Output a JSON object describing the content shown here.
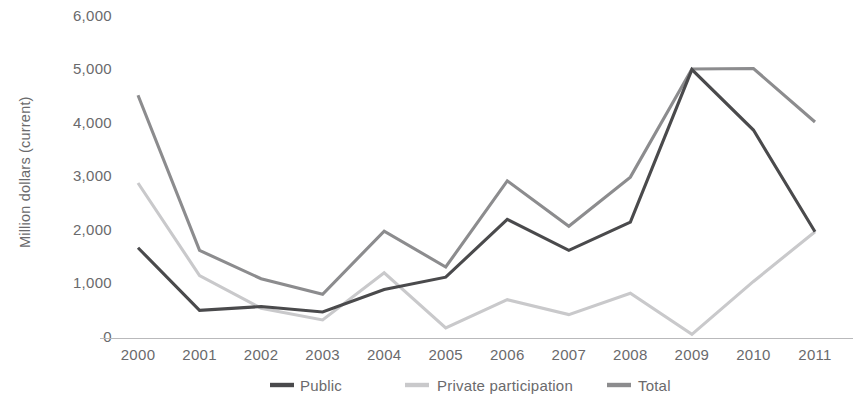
{
  "chart_data": {
    "type": "line",
    "title": "",
    "subtitle": "",
    "xlabel": "",
    "ylabel": "Million dollars (current)",
    "categories": [
      "2000",
      "2001",
      "2002",
      "2003",
      "2004",
      "2005",
      "2006",
      "2007",
      "2008",
      "2009",
      "2010",
      "2011"
    ],
    "x": [
      2000,
      2001,
      2002,
      2003,
      2004,
      2005,
      2006,
      2007,
      2008,
      2009,
      2010,
      2011
    ],
    "ylim": [
      0,
      6000
    ],
    "yticks": [
      0,
      1000,
      2000,
      3000,
      4000,
      5000,
      6000
    ],
    "ytick_labels": [
      "0",
      "1,000",
      "2,000",
      "3,000",
      "4,000",
      "5,000",
      "6,000"
    ],
    "grid": false,
    "legend_position": "bottom",
    "series": [
      {
        "name": "Public",
        "color": "#4a4a4c",
        "values": [
          1650,
          480,
          550,
          450,
          870,
          1100,
          2180,
          1600,
          2130,
          4980,
          3850,
          1950
        ]
      },
      {
        "name": "Private participation",
        "color": "#c9c9cb",
        "values": [
          2860,
          1130,
          520,
          300,
          1180,
          150,
          680,
          400,
          800,
          30,
          1020,
          1950
        ]
      },
      {
        "name": "Total",
        "color": "#8c8c8e",
        "values": [
          4500,
          1600,
          1070,
          780,
          1960,
          1290,
          2900,
          2050,
          2970,
          4990,
          5000,
          4000
        ]
      }
    ]
  },
  "axes": {
    "y_axis_title": "Million dollars (current)",
    "y_tick_labels": [
      "6,000",
      "5,000",
      "4,000",
      "3,000",
      "2,000",
      "1,000",
      "0"
    ],
    "x_tick_labels": [
      "2000",
      "2001",
      "2002",
      "2003",
      "2004",
      "2005",
      "2006",
      "2007",
      "2008",
      "2009",
      "2010",
      "2011"
    ]
  },
  "legend": {
    "items": [
      {
        "label": "Public",
        "color": "#4a4a4c"
      },
      {
        "label": "Private participation",
        "color": "#c9c9cb"
      },
      {
        "label": "Total",
        "color": "#8c8c8e"
      }
    ]
  },
  "colors": {
    "background": "#ffffff",
    "axis": "#b9b9bb",
    "text": "#6a6a6c",
    "public": "#4a4a4c",
    "private": "#c9c9cb",
    "total": "#8c8c8e"
  }
}
